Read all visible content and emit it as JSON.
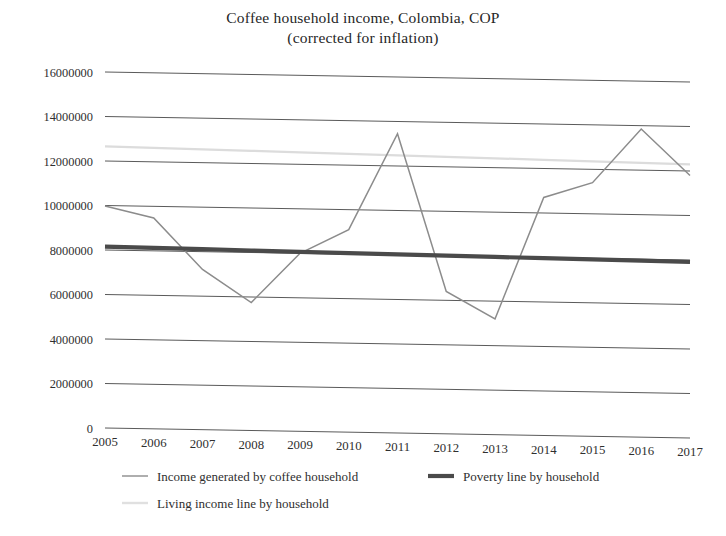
{
  "chart_data": {
    "type": "line",
    "title": "Coffee household income, Colombia, COP",
    "subtitle": "(corrected for inflation)",
    "xlabel": "",
    "ylabel": "",
    "ylim": [
      0,
      16000000
    ],
    "ytick_step": 2000000,
    "grid": true,
    "legend_position": "bottom",
    "categories": [
      "2005",
      "2006",
      "2007",
      "2008",
      "2009",
      "2010",
      "2011",
      "2012",
      "2013",
      "2014",
      "2015",
      "2016",
      "2017"
    ],
    "ytick_labels": [
      "16000000",
      "14000000",
      "12000000",
      "10000000",
      "8000000",
      "6000000",
      "4000000",
      "2000000",
      "0"
    ],
    "ytick_values": [
      16000000,
      14000000,
      12000000,
      10000000,
      8000000,
      6000000,
      4000000,
      2000000,
      0
    ],
    "series": [
      {
        "name": "Income generated by coffee household",
        "color": "#8c8c8c",
        "values": [
          9980000,
          9480000,
          7200000,
          5750000,
          8000000,
          9100000,
          13450000,
          6400000,
          5200000,
          10700000,
          11400000,
          13850000,
          11800000
        ]
      },
      {
        "name": "Poverty line by household",
        "color": "#4a4a4a",
        "values": [
          8150000,
          8130000,
          8110000,
          8090000,
          8070000,
          8050000,
          8030000,
          8010000,
          7990000,
          7970000,
          7950000,
          7930000,
          7910000
        ]
      },
      {
        "name": "Living income line by household",
        "color": "#dcdcdc",
        "values": [
          12660000,
          12630000,
          12600000,
          12570000,
          12540000,
          12510000,
          12480000,
          12450000,
          12420000,
          12390000,
          12360000,
          12330000,
          12300000
        ]
      }
    ]
  },
  "legend": {
    "entries": [
      {
        "label": "Income generated by coffee household",
        "marker": "line-marker-income"
      },
      {
        "label": "Poverty line by household",
        "marker": "line-marker-poverty"
      },
      {
        "label": "Living income line by household",
        "marker": "line-marker-living"
      }
    ]
  }
}
